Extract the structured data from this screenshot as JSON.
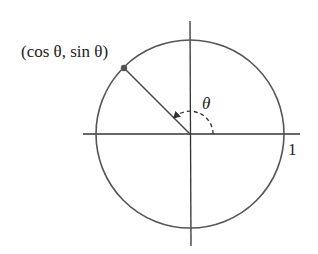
{
  "diagram": {
    "point_label": "(cos θ, sin θ)",
    "angle_label": "θ",
    "radius_label": "1",
    "center": [
      190,
      134
    ],
    "radius": 94,
    "angle_degrees": 135,
    "angle_arc_radius": 23,
    "colors": {
      "circle": "#555555",
      "axes": "#333333",
      "radius_line": "#444444",
      "point": "#555555",
      "arc": "#333333"
    }
  }
}
